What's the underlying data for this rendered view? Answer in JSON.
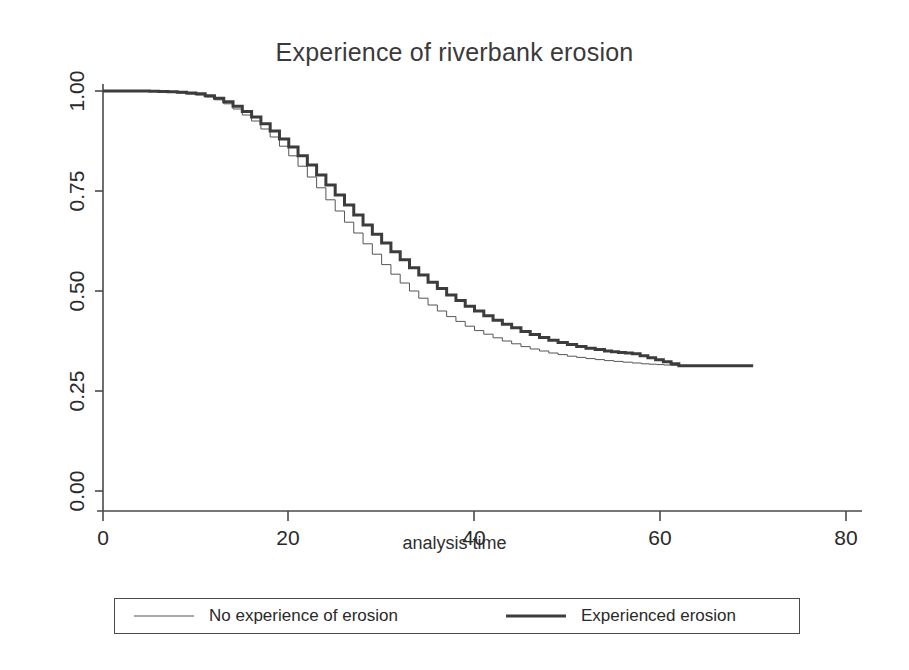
{
  "chart_data": {
    "type": "line",
    "subtype": "kaplan-meier-step",
    "title": "Experience of riverbank erosion",
    "xlabel": "analysis time",
    "ylabel": "",
    "xlim": [
      0,
      80
    ],
    "ylim": [
      0,
      1.0
    ],
    "xticks": [
      0,
      20,
      40,
      60,
      80
    ],
    "xtick_labels": [
      "0",
      "20",
      "40",
      "60",
      "80"
    ],
    "yticks": [
      0.0,
      0.25,
      0.5,
      0.75,
      1.0
    ],
    "ytick_labels": [
      "0.00",
      "0.25",
      "0.50",
      "0.75",
      "1.00"
    ],
    "grid": false,
    "legend_position": "bottom-outside",
    "series": [
      {
        "name": "No experience of erosion",
        "style": "thin",
        "line_width": 1,
        "color": "#555555",
        "x": [
          0,
          2,
          4,
          6,
          8,
          10,
          11,
          12,
          13,
          14,
          15,
          16,
          17,
          18,
          19,
          20,
          21,
          22,
          23,
          24,
          25,
          26,
          27,
          28,
          29,
          30,
          31,
          32,
          33,
          34,
          35,
          36,
          37,
          38,
          39,
          40,
          41,
          42,
          43,
          44,
          45,
          46,
          47,
          48,
          49,
          50,
          51,
          52,
          54,
          56,
          58,
          62,
          70
        ],
        "y": [
          1.0,
          1.0,
          1.0,
          0.998,
          0.995,
          0.99,
          0.985,
          0.978,
          0.968,
          0.955,
          0.94,
          0.925,
          0.905,
          0.885,
          0.862,
          0.838,
          0.812,
          0.785,
          0.758,
          0.728,
          0.7,
          0.672,
          0.645,
          0.618,
          0.592,
          0.566,
          0.542,
          0.52,
          0.5,
          0.482,
          0.465,
          0.45,
          0.436,
          0.424,
          0.412,
          0.401,
          0.392,
          0.383,
          0.375,
          0.368,
          0.361,
          0.355,
          0.35,
          0.345,
          0.341,
          0.337,
          0.334,
          0.331,
          0.326,
          0.322,
          0.318,
          0.313,
          0.313
        ]
      },
      {
        "name": "Experienced erosion",
        "style": "thick",
        "line_width": 3,
        "color": "#3c3c3c",
        "x": [
          0,
          2,
          4,
          6,
          8,
          10,
          11,
          12,
          13,
          14,
          15,
          16,
          17,
          18,
          19,
          20,
          21,
          22,
          23,
          24,
          25,
          26,
          27,
          28,
          29,
          30,
          31,
          32,
          33,
          34,
          35,
          36,
          37,
          38,
          39,
          40,
          41,
          42,
          43,
          44,
          45,
          46,
          47,
          48,
          49,
          50,
          52,
          54,
          57,
          62,
          70
        ],
        "y": [
          1.0,
          1.0,
          1.0,
          0.999,
          0.997,
          0.993,
          0.988,
          0.982,
          0.973,
          0.962,
          0.949,
          0.935,
          0.918,
          0.9,
          0.88,
          0.86,
          0.838,
          0.815,
          0.79,
          0.765,
          0.74,
          0.715,
          0.69,
          0.665,
          0.642,
          0.62,
          0.598,
          0.578,
          0.558,
          0.54,
          0.522,
          0.506,
          0.49,
          0.476,
          0.462,
          0.45,
          0.438,
          0.427,
          0.417,
          0.408,
          0.399,
          0.391,
          0.384,
          0.377,
          0.371,
          0.366,
          0.357,
          0.35,
          0.343,
          0.313,
          0.313
        ]
      }
    ]
  },
  "chart": {
    "title": "Experience of riverbank erosion",
    "xaxis_title": "analysis time",
    "xtick_labels": [
      "0",
      "20",
      "40",
      "60",
      "80"
    ],
    "ytick_labels": [
      "0.00",
      "0.25",
      "0.50",
      "0.75",
      "1.00"
    ]
  },
  "legend": {
    "entries": [
      {
        "label": "No experience of erosion",
        "style": "thin"
      },
      {
        "label": "Experienced erosion",
        "style": "thick"
      }
    ]
  },
  "colors": {
    "axis": "#4a4a4a",
    "series_thin": "#555555",
    "series_thick": "#3c3c3c",
    "text": "#2a2a2a",
    "background": "#ffffff"
  }
}
